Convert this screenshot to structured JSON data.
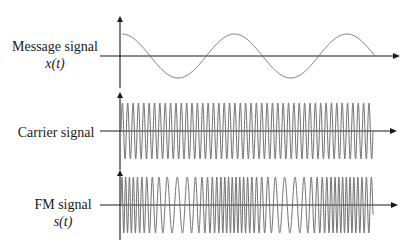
{
  "diagram": {
    "colors": {
      "axis": "#1a1a1a",
      "wave": "#6e6e6e",
      "background": "#ffffff"
    },
    "panels": [
      {
        "id": "message",
        "label_line1": "Message signal",
        "label_line2": "x(t)",
        "waveform": "cosine",
        "cycles": 2.25,
        "description": "Low-frequency sinusoidal message starting at peak"
      },
      {
        "id": "carrier",
        "label_line1": "Carrier signal",
        "label_line2": "",
        "waveform": "high-frequency sinusoid",
        "cycles": 47,
        "description": "Constant-frequency carrier"
      },
      {
        "id": "fm",
        "label_line1": "FM signal",
        "label_line2": "s(t)",
        "waveform": "frequency-modulated sinusoid",
        "description": "Instantaneous frequency highest at message peaks, lowest at message troughs"
      }
    ]
  }
}
